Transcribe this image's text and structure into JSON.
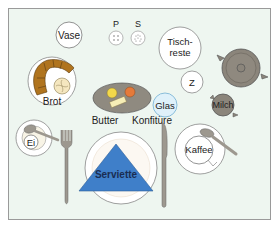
{
  "diagram": {
    "colors": {
      "background": "#eef6f0",
      "frame_border": "#9a9a9a",
      "plate_fill": "#ffffff",
      "plate_stroke": "#888888",
      "bread": "#b0741e",
      "bread_roll": "#f5e7bf",
      "tray": "#8f8a80",
      "butter_yellow": "#f3d84a",
      "jam_orange": "#e57a3a",
      "butter_block": "#f6eeb6",
      "glass_fill": "#dff1fa",
      "glass_stroke": "#7fb7d6",
      "pot": "#8b857b",
      "napkin": "#3f7fc9",
      "cutlery": "#9d988f"
    },
    "labels": {
      "vase": "Vase",
      "pepper": "P",
      "salt": "S",
      "leftovers": "Tisch-",
      "leftovers2": "reste",
      "bread": "Brot",
      "sugar": "Z",
      "glass": "Glas",
      "milk": "Milch",
      "butter": "Butter",
      "jam": "Konfitüre",
      "egg": "Ei",
      "napkin": "Serviette",
      "coffee": "Kaffee"
    }
  }
}
